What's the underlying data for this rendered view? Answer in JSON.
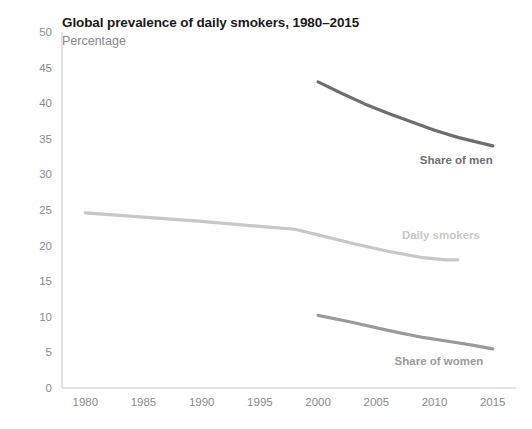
{
  "chart_data": {
    "type": "line",
    "title": "Global prevalence of daily smokers, 1980–2015",
    "subtitle": "Percentage",
    "xlabel": "",
    "ylabel": "",
    "xlim": [
      1978,
      2017
    ],
    "ylim": [
      0,
      50
    ],
    "grid": false,
    "legend_position": "inline-end-of-line",
    "yticks": [
      "0",
      "5",
      "10",
      "15",
      "20",
      "25",
      "30",
      "35",
      "40",
      "45",
      "50"
    ],
    "xticks": [
      "1980",
      "1985",
      "1990",
      "1995",
      "2000",
      "2005",
      "2010",
      "2015"
    ],
    "series": [
      {
        "name": "Share of men",
        "color": "#6e6e6e",
        "label": "Share of men",
        "x": [
          2000,
          2002,
          2004,
          2006,
          2008,
          2010,
          2012,
          2015
        ],
        "values": [
          43.0,
          41.4,
          39.9,
          38.6,
          37.4,
          36.2,
          35.2,
          34.0
        ]
      },
      {
        "name": "Daily smokers",
        "color": "#c8c8c8",
        "label": "Daily smokers",
        "x": [
          1980,
          1985,
          1990,
          1995,
          1998,
          2000,
          2003,
          2006,
          2009,
          2011,
          2012
        ],
        "values": [
          24.6,
          24.0,
          23.4,
          22.7,
          22.3,
          21.5,
          20.3,
          19.2,
          18.3,
          18.0,
          18.0
        ]
      },
      {
        "name": "Share of women",
        "color": "#9a9a9a",
        "label": "Share of women",
        "x": [
          2000,
          2003,
          2006,
          2009,
          2011,
          2013,
          2015
        ],
        "values": [
          10.2,
          9.2,
          8.1,
          7.1,
          6.6,
          6.1,
          5.5
        ]
      }
    ]
  }
}
